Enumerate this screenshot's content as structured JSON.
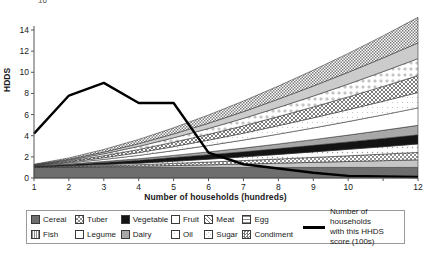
{
  "axes": {
    "y_label": "HDDS",
    "x_label": "Number of households (hundreds)",
    "y_ticks": [
      "0",
      "2",
      "4",
      "6",
      "8",
      "10",
      "12",
      "14"
    ],
    "x_ticks": [
      "1",
      "2",
      "3",
      "4",
      "5",
      "6",
      "7",
      "8",
      "9",
      "10",
      "",
      "12"
    ],
    "top_clipped_tick": "16"
  },
  "legend": {
    "col1": [
      {
        "label": "Cereal",
        "pattern": "solid-dark-gray",
        "color": "#6e6e6e"
      },
      {
        "label": "Fish",
        "pattern": "vertical-lines",
        "color": "#b5b5b5"
      }
    ],
    "col2": [
      {
        "label": "Tuber",
        "pattern": "checker-gray",
        "color": "#9b9b9b"
      },
      {
        "label": "Legume",
        "pattern": "dots-light",
        "color": "#ededed"
      }
    ],
    "col3": [
      {
        "label": "Vegetable",
        "pattern": "solid-black",
        "color": "#111111"
      },
      {
        "label": "Dairy",
        "pattern": "solid-mid-gray",
        "color": "#a8a8a8"
      }
    ],
    "col4": [
      {
        "label": "Fruit",
        "pattern": "white",
        "color": "#ffffff"
      },
      {
        "label": "Oil",
        "pattern": "white-outline",
        "color": "#fdfdfd"
      }
    ],
    "col5": [
      {
        "label": "Meat",
        "pattern": "crosshatch",
        "color": "#8a8a8a"
      },
      {
        "label": "Sugar",
        "pattern": "sparse-dots",
        "color": "#f2f2f2"
      }
    ],
    "col6": [
      {
        "label": "Egg",
        "pattern": "horizontal-lines",
        "color": "#cfcfcf"
      },
      {
        "label": "Condiment",
        "pattern": "fine-checker",
        "color": "#8f8f8f"
      }
    ],
    "line_entry": {
      "line1": "Number of households",
      "line2": "with this HHDS score (100s)",
      "color": "#000000"
    }
  },
  "chart_data": {
    "type": "area",
    "title": "",
    "xlabel": "Number of households (hundreds)",
    "ylabel": "HDDS",
    "xlim": [
      1,
      12
    ],
    "ylim": [
      0,
      14
    ],
    "grid": false,
    "legend_position": "bottom",
    "x": [
      1,
      2,
      3,
      4,
      5,
      6,
      7,
      8,
      9,
      10,
      11,
      12
    ],
    "stacked_series": [
      {
        "name": "Cereal",
        "values": [
          1.0,
          1.0,
          1.0,
          1.0,
          1.0,
          1.0,
          1.0,
          1.0,
          1.0,
          1.0,
          1.0,
          1.0
        ]
      },
      {
        "name": "Fish",
        "values": [
          0.02,
          0.05,
          0.08,
          0.12,
          0.18,
          0.25,
          0.32,
          0.4,
          0.48,
          0.56,
          0.64,
          0.72
        ]
      },
      {
        "name": "Tuber",
        "values": [
          0.03,
          0.06,
          0.1,
          0.14,
          0.2,
          0.26,
          0.33,
          0.4,
          0.47,
          0.54,
          0.62,
          0.7
        ]
      },
      {
        "name": "Legume",
        "values": [
          0.02,
          0.05,
          0.09,
          0.14,
          0.2,
          0.27,
          0.35,
          0.43,
          0.52,
          0.61,
          0.7,
          0.8
        ]
      },
      {
        "name": "Vegetable",
        "values": [
          0.05,
          0.12,
          0.2,
          0.28,
          0.36,
          0.42,
          0.48,
          0.55,
          0.62,
          0.7,
          0.78,
          0.86
        ]
      },
      {
        "name": "Dairy",
        "values": [
          0.02,
          0.05,
          0.09,
          0.14,
          0.2,
          0.27,
          0.35,
          0.44,
          0.54,
          0.65,
          0.77,
          0.9
        ]
      },
      {
        "name": "Fruit",
        "values": [
          0.03,
          0.1,
          0.2,
          0.32,
          0.45,
          0.6,
          0.76,
          0.93,
          1.1,
          1.28,
          1.46,
          1.65
        ]
      },
      {
        "name": "Oil",
        "values": [
          0.02,
          0.08,
          0.16,
          0.26,
          0.38,
          0.51,
          0.65,
          0.8,
          0.96,
          1.12,
          1.29,
          1.46
        ]
      },
      {
        "name": "Meat",
        "values": [
          0.03,
          0.1,
          0.19,
          0.3,
          0.42,
          0.55,
          0.7,
          0.86,
          1.03,
          1.21,
          1.4,
          1.6
        ]
      },
      {
        "name": "Sugar",
        "values": [
          0.02,
          0.09,
          0.18,
          0.29,
          0.41,
          0.55,
          0.7,
          0.86,
          1.03,
          1.21,
          1.4,
          1.6
        ]
      },
      {
        "name": "Egg",
        "values": [
          0.02,
          0.08,
          0.16,
          0.26,
          0.37,
          0.5,
          0.64,
          0.79,
          0.95,
          1.12,
          1.3,
          1.49
        ]
      },
      {
        "name": "Condiment",
        "values": [
          0.04,
          0.12,
          0.25,
          0.4,
          0.58,
          0.78,
          1.0,
          1.24,
          1.5,
          1.78,
          2.08,
          2.42
        ]
      }
    ],
    "line_series": {
      "name": "Number of households with this HHDS score (100s)",
      "color": "#000000",
      "values": [
        4.2,
        7.8,
        9.0,
        7.1,
        7.1,
        2.4,
        1.3,
        0.9,
        0.5,
        0.2,
        0.15,
        0.1
      ]
    }
  }
}
